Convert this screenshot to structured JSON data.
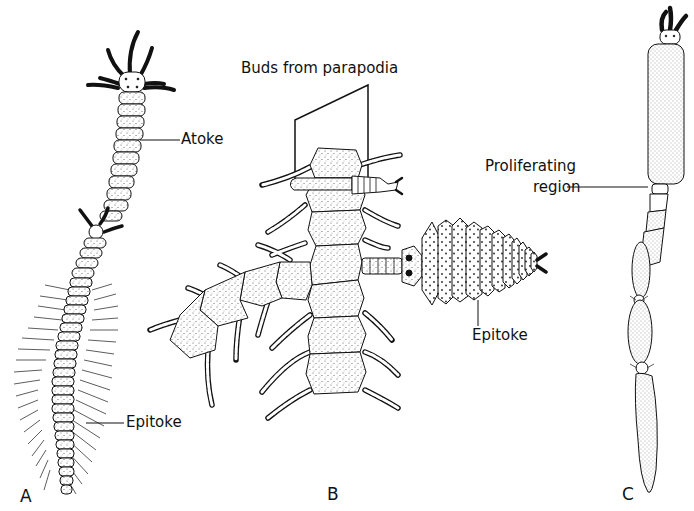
{
  "figure": {
    "panels": [
      {
        "id": "A",
        "label": "A",
        "callouts": [
          "Atoke",
          "Epitoke"
        ]
      },
      {
        "id": "B",
        "label": "B",
        "callouts": [
          "Buds from parapodia",
          "Epitoke"
        ]
      },
      {
        "id": "C",
        "label": "C",
        "callouts": [
          "Proliferating region"
        ]
      }
    ]
  },
  "labels": {
    "atoke": "Atoke",
    "epitoke_a": "Epitoke",
    "buds": "Buds from parapodia",
    "epitoke_b": "Epitoke",
    "proliferating_1": "Proliferating",
    "proliferating_2": "region",
    "panel_a": "A",
    "panel_b": "B",
    "panel_c": "C"
  },
  "colors": {
    "ink": "#111111",
    "background": "#ffffff",
    "stipple_fill": "#eeeeee"
  }
}
